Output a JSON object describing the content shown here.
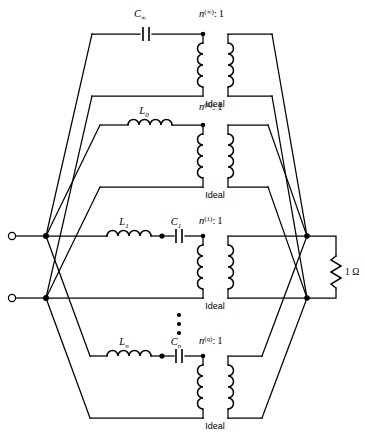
{
  "figure": {
    "type": "circuit-schematic",
    "load_label": "1 Ω",
    "ideal_label": "Ideal",
    "vertical_ellipsis": "⋮"
  },
  "branches": [
    {
      "id": "branch-infinity",
      "series_elements": [
        {
          "kind": "capacitor",
          "base": "C",
          "sub": "∞"
        }
      ],
      "transformer": {
        "base": "n",
        "sup": "(∞)",
        "ratio_separator": ":",
        "secondary": "1",
        "full_label": "n(∞) : 1",
        "ideal_label": "Ideal"
      }
    },
    {
      "id": "branch-0",
      "series_elements": [
        {
          "kind": "inductor",
          "base": "L",
          "sub": "0"
        }
      ],
      "transformer": {
        "base": "n",
        "sup": "(0)",
        "ratio_separator": ":",
        "secondary": "1",
        "full_label": "n(0) : 1",
        "ideal_label": "Ideal"
      }
    },
    {
      "id": "branch-1",
      "series_elements": [
        {
          "kind": "inductor",
          "base": "L",
          "sub": "1"
        },
        {
          "kind": "capacitor",
          "base": "C",
          "sub": "1"
        }
      ],
      "transformer": {
        "base": "n",
        "sup": "(1)",
        "ratio_separator": ":",
        "secondary": "1",
        "full_label": "n(1) : 1",
        "ideal_label": "Ideal"
      }
    },
    {
      "id": "branch-n",
      "series_elements": [
        {
          "kind": "inductor",
          "base": "L",
          "sub": "n"
        },
        {
          "kind": "capacitor",
          "base": "C",
          "sub": "n"
        }
      ],
      "transformer": {
        "base": "n",
        "sup": "(q)",
        "ratio_separator": ":",
        "secondary": "1",
        "full_label": "n(q) : 1",
        "ideal_label": "Ideal"
      }
    }
  ],
  "terminals": {
    "top_terminal_name": "input-terminal-top",
    "bottom_terminal_name": "input-terminal-bottom"
  },
  "load": {
    "name": "load-resistor",
    "value": "1",
    "unit": "Ω",
    "label": "1 Ω"
  }
}
